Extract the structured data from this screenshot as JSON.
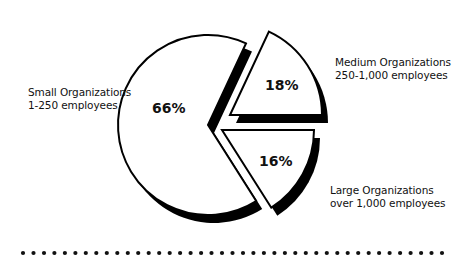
{
  "chart_data": {
    "type": "pie",
    "title": "",
    "categories": [
      "Small Organizations 1-250 employees",
      "Medium Organizations 250-1,000 employees",
      "Large Organizations over 1,000 employees"
    ],
    "values": [
      66,
      18,
      16
    ],
    "unit": "%",
    "exploded": true,
    "shadow": true,
    "legend_position": "labels adjacent to slices"
  },
  "slices": [
    {
      "key": "small",
      "pct_label": "66%",
      "line1": "Small Organizations",
      "line2": "1-250 employees"
    },
    {
      "key": "medium",
      "pct_label": "18%",
      "line1": "Medium Organizations",
      "line2": "250-1,000 employees"
    },
    {
      "key": "large",
      "pct_label": "16%",
      "line1": "Large Organizations",
      "line2": "over 1,000 employees"
    }
  ],
  "colors": {
    "fill": "#ffffff",
    "stroke": "#000000",
    "shadow": "#000000",
    "dots": "#111111"
  },
  "divider": {
    "dot_count": 41
  }
}
